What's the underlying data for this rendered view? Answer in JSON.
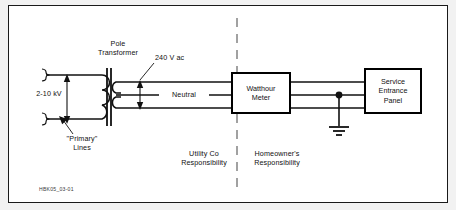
{
  "figure": {
    "code": "HBK05_03-01",
    "border_color": "#1a1a1a",
    "background": "#ffffff",
    "page_background": "#f2f2f2"
  },
  "labels": {
    "primary_voltage": "2-10 kV",
    "primary_lines": "\"Primary\"\nLines",
    "pole_transformer": "Pole\nTransformer",
    "secondary_voltage": "240 V ac",
    "neutral": "Neutral",
    "utility": "Utility Co\nResponsibility",
    "homeowner": "Homeowner's\nResponsibility"
  },
  "devices": [
    {
      "name": "watthour-meter",
      "label": "Watthour\nMeter",
      "x": 222,
      "y": 66,
      "width": 60,
      "height": 42
    },
    {
      "name": "service-entrance-panel",
      "label": "Service\nEntrance\nPanel",
      "x": 355,
      "y": 62,
      "width": 58,
      "height": 46
    }
  ],
  "symbols": {
    "ground": "earth-ground",
    "junction": "wire-junction-dot",
    "divider": "responsibility-dashed-divider",
    "transformer_core": "laminated-core",
    "primary_winding_turns": 3,
    "secondary_winding_turns": 4
  },
  "colors": {
    "wire": "#111111",
    "text": "#111111",
    "divider": "#555555"
  }
}
